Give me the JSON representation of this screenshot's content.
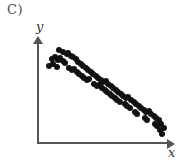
{
  "figure": {
    "panel_label": "C)",
    "background_color": "#ffffff"
  },
  "axes": {
    "x_label": "x",
    "y_label": "y",
    "axis_color": "#555555",
    "has_arrow_heads": true,
    "has_tick_labels": false,
    "has_gridlines": false
  },
  "marker": {
    "color": "#111111",
    "shape": "circle",
    "size_px": 6
  },
  "chart_data": {
    "type": "scatter",
    "title": "C)",
    "xlabel": "x",
    "ylabel": "y",
    "xlim": [
      0,
      100
    ],
    "ylim": [
      0,
      100
    ],
    "grid": false,
    "legend": null,
    "annotations": [],
    "series": [
      {
        "name": "points",
        "x": [
          16,
          19,
          22,
          23,
          25,
          10,
          13,
          15,
          17,
          19,
          21,
          8,
          11,
          14,
          27,
          29,
          31,
          33,
          35,
          24,
          26,
          28,
          30,
          37,
          39,
          41,
          43,
          45,
          32,
          34,
          36,
          38,
          40,
          47,
          49,
          51,
          53,
          55,
          44,
          46,
          48,
          50,
          57,
          59,
          61,
          63,
          52,
          54,
          56,
          58,
          65,
          67,
          69,
          71,
          60,
          62,
          64,
          73,
          75,
          77,
          79,
          68,
          70,
          72,
          81,
          83,
          85,
          87,
          76,
          78,
          89,
          91,
          93,
          95,
          84,
          86,
          97,
          99,
          92,
          94,
          96,
          98
        ],
        "y": [
          92,
          90,
          88,
          89,
          86,
          83,
          85,
          82,
          84,
          81,
          79,
          76,
          78,
          75,
          85,
          83,
          80,
          78,
          76,
          74,
          72,
          73,
          70,
          74,
          72,
          70,
          68,
          66,
          68,
          66,
          64,
          62,
          63,
          64,
          62,
          60,
          61,
          58,
          58,
          56,
          57,
          54,
          56,
          54,
          52,
          50,
          52,
          50,
          48,
          46,
          48,
          46,
          44,
          45,
          44,
          42,
          40,
          42,
          40,
          38,
          36,
          38,
          36,
          34,
          34,
          32,
          30,
          31,
          30,
          28,
          28,
          26,
          24,
          22,
          24,
          22,
          18,
          14,
          18,
          16,
          12,
          8
        ]
      }
    ]
  }
}
